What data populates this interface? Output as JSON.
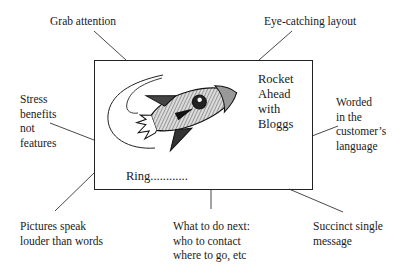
{
  "diagram": {
    "card": {
      "headline_lines": [
        "Rocket",
        "Ahead",
        "with",
        "Bloggs"
      ],
      "call_to_action": "Ring............",
      "image": "rocket-illustration"
    },
    "annotations": {
      "top_left": "Grab attention",
      "top_right": "Eye-catching layout",
      "left": [
        "Stress",
        "benefits",
        "not",
        "features"
      ],
      "right": [
        "Worded",
        "in the",
        "customer’s",
        "language"
      ],
      "bottom_left": [
        "Pictures speak",
        "louder than words"
      ],
      "bottom_center": [
        "What to do next:",
        "who to contact",
        "where to go, etc"
      ],
      "bottom_right": [
        "Succinct single",
        "message"
      ]
    },
    "colors": {
      "line": "#222222",
      "text": "#1a1a1a",
      "background": "#ffffff"
    }
  }
}
